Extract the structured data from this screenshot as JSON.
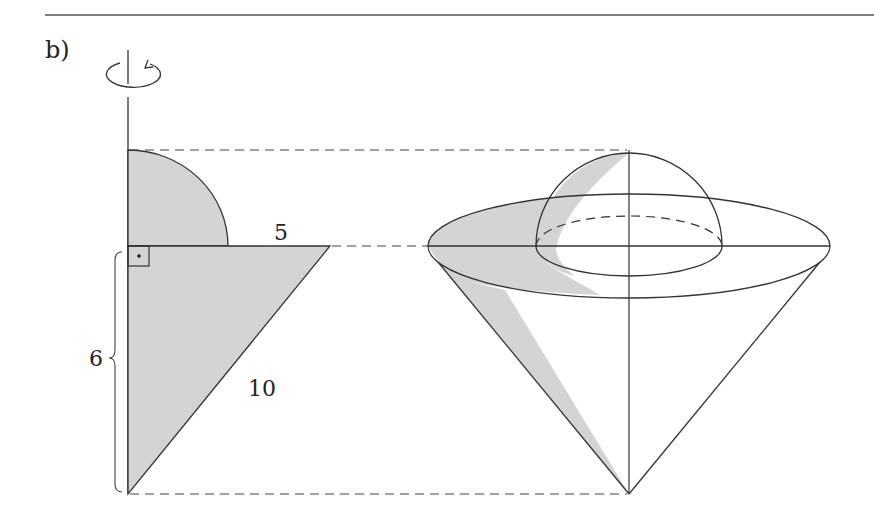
{
  "part_label": "b)",
  "labels": {
    "radius": "5",
    "height": "6",
    "slant": "10"
  },
  "icons": {
    "rotation": "rotation-arrow-icon",
    "right_angle": "right-angle-marker-icon"
  },
  "colors": {
    "line": "#333333",
    "fill": "#d4d4d4",
    "rule": "#555555"
  },
  "figure": {
    "left": "cross-section: quarter circle on top of right triangle, rotated about vertical axis",
    "right": "solid of revolution: hemisphere on top of inverted cone"
  }
}
